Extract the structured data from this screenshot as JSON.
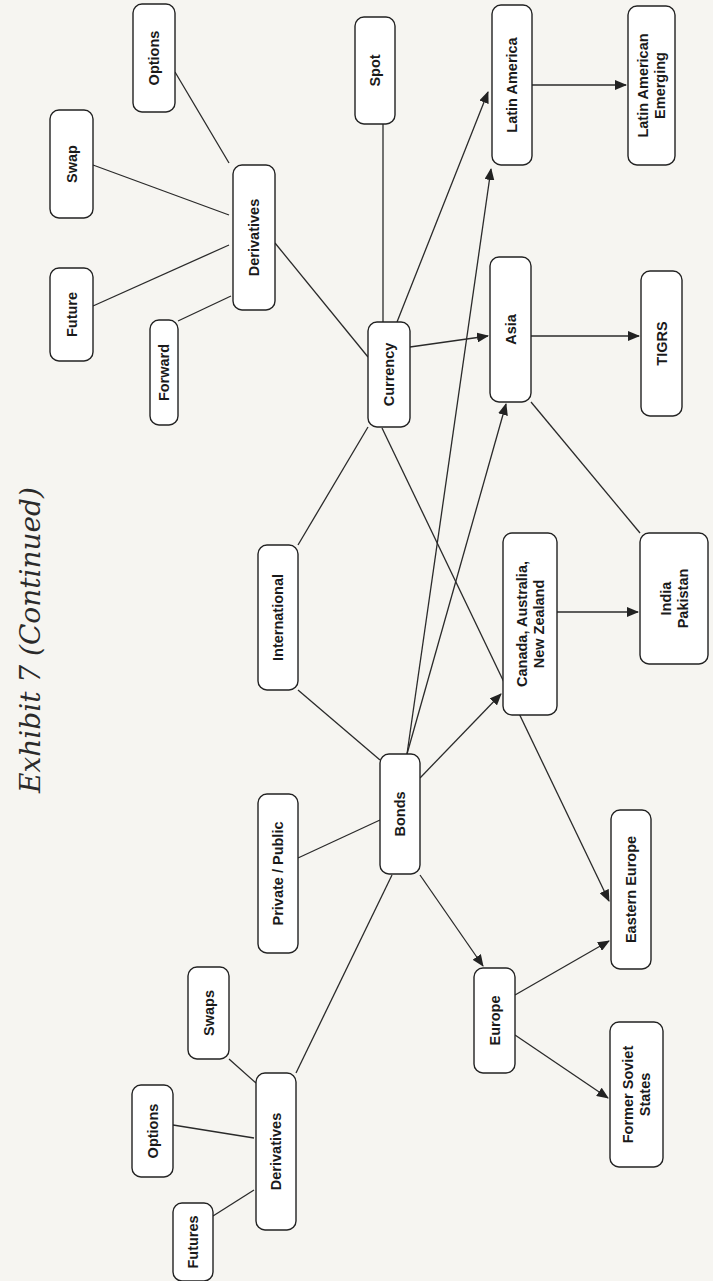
{
  "page": {
    "title": "Exhibit 7 (Continued)",
    "colors": {
      "background": "#f6f5f1",
      "node_fill": "#ffffff",
      "line": "#2a2a2a",
      "text": "#1a1a1a"
    }
  },
  "diagram": {
    "orientation": "rotated-90-ccw",
    "nodes": [
      {
        "id": "options_top",
        "label": [
          "Options"
        ],
        "x": 133,
        "y": 4,
        "w": 42,
        "h": 108
      },
      {
        "id": "swap",
        "label": [
          "Swap"
        ],
        "x": 50,
        "y": 110,
        "w": 43,
        "h": 108
      },
      {
        "id": "future",
        "label": [
          "Future"
        ],
        "x": 50,
        "y": 268,
        "w": 43,
        "h": 93
      },
      {
        "id": "forward",
        "label": [
          "Forward"
        ],
        "x": 150,
        "y": 320,
        "w": 28,
        "h": 105
      },
      {
        "id": "derivatives_top",
        "label": [
          "Derivatives"
        ],
        "x": 233,
        "y": 165,
        "w": 42,
        "h": 145
      },
      {
        "id": "spot",
        "label": [
          "Spot"
        ],
        "x": 355,
        "y": 17,
        "w": 40,
        "h": 107
      },
      {
        "id": "currency",
        "label": [
          "Currency"
        ],
        "x": 368,
        "y": 322,
        "w": 42,
        "h": 105
      },
      {
        "id": "latin_america",
        "label": [
          "Latin America"
        ],
        "x": 492,
        "y": 5,
        "w": 40,
        "h": 160
      },
      {
        "id": "latin_american_emerging",
        "label": [
          "Latin American",
          "Emerging"
        ],
        "x": 628,
        "y": 6,
        "w": 47,
        "h": 159
      },
      {
        "id": "asia",
        "label": [
          "Asia"
        ],
        "x": 490,
        "y": 257,
        "w": 41,
        "h": 145
      },
      {
        "id": "tigrs",
        "label": [
          "TIGRS"
        ],
        "x": 641,
        "y": 271,
        "w": 41,
        "h": 145
      },
      {
        "id": "international",
        "label": [
          "International"
        ],
        "x": 258,
        "y": 545,
        "w": 40,
        "h": 145
      },
      {
        "id": "canada",
        "label": [
          "Canada, Australia,",
          "New Zealand"
        ],
        "x": 503,
        "y": 533,
        "w": 54,
        "h": 182
      },
      {
        "id": "india_pakistan",
        "label": [
          "India",
          "Pakistan"
        ],
        "x": 640,
        "y": 533,
        "w": 68,
        "h": 131
      },
      {
        "id": "bonds",
        "label": [
          "Bonds"
        ],
        "x": 380,
        "y": 754,
        "w": 40,
        "h": 120
      },
      {
        "id": "private_public",
        "label": [
          "Private / Public"
        ],
        "x": 258,
        "y": 794,
        "w": 40,
        "h": 159
      },
      {
        "id": "eastern_europe",
        "label": [
          "Eastern Europe"
        ],
        "x": 611,
        "y": 810,
        "w": 40,
        "h": 159
      },
      {
        "id": "europe",
        "label": [
          "Europe"
        ],
        "x": 474,
        "y": 968,
        "w": 41,
        "h": 105
      },
      {
        "id": "former_soviet_states",
        "label": [
          "Former Soviet",
          "States"
        ],
        "x": 610,
        "y": 1022,
        "w": 53,
        "h": 145
      },
      {
        "id": "swaps",
        "label": [
          "Swaps"
        ],
        "x": 188,
        "y": 967,
        "w": 41,
        "h": 92
      },
      {
        "id": "options_bottom",
        "label": [
          "Options"
        ],
        "x": 132,
        "y": 1085,
        "w": 41,
        "h": 92
      },
      {
        "id": "derivatives_bottom",
        "label": [
          "Derivatives"
        ],
        "x": 256,
        "y": 1073,
        "w": 40,
        "h": 157
      },
      {
        "id": "futures",
        "label": [
          "Futures"
        ],
        "x": 173,
        "y": 1203,
        "w": 40,
        "h": 78
      }
    ],
    "edges": [
      {
        "from": [
          229,
          163
        ],
        "to": [
          175,
          72
        ],
        "arrow": false
      },
      {
        "from": [
          229,
          215
        ],
        "to": [
          93,
          165
        ],
        "arrow": false
      },
      {
        "from": [
          229,
          245
        ],
        "to": [
          93,
          306
        ],
        "arrow": false
      },
      {
        "from": [
          231,
          296
        ],
        "to": [
          178,
          321
        ],
        "arrow": false
      },
      {
        "from": [
          275,
          243
        ],
        "to": [
          368,
          357
        ],
        "arrow": false
      },
      {
        "from": [
          383,
          124
        ],
        "to": [
          383,
          322
        ],
        "arrow": false
      },
      {
        "from": [
          397,
          322
        ],
        "to": [
          488,
          92
        ],
        "arrow": true
      },
      {
        "from": [
          410,
          347
        ],
        "to": [
          488,
          336
        ],
        "arrow": true
      },
      {
        "from": [
          532,
          85
        ],
        "to": [
          626,
          85
        ],
        "arrow": true
      },
      {
        "from": [
          531,
          336
        ],
        "to": [
          639,
          336
        ],
        "arrow": true
      },
      {
        "from": [
          298,
          545
        ],
        "to": [
          368,
          427
        ],
        "arrow": false
      },
      {
        "from": [
          382,
          428
        ],
        "to": [
          609,
          901
        ],
        "arrow": true
      },
      {
        "from": [
          407,
          754
        ],
        "to": [
          491,
          169
        ],
        "arrow": true
      },
      {
        "from": [
          407,
          754
        ],
        "to": [
          506,
          404
        ],
        "arrow": true
      },
      {
        "from": [
          531,
          402
        ],
        "to": [
          640,
          533
        ],
        "arrow": false
      },
      {
        "from": [
          557,
          612
        ],
        "to": [
          638,
          612
        ],
        "arrow": true
      },
      {
        "from": [
          298,
          690
        ],
        "to": [
          380,
          760
        ],
        "arrow": false
      },
      {
        "from": [
          420,
          778
        ],
        "to": [
          501,
          694
        ],
        "arrow": true
      },
      {
        "from": [
          380,
          820
        ],
        "to": [
          298,
          858
        ],
        "arrow": false
      },
      {
        "from": [
          420,
          875
        ],
        "to": [
          483,
          966
        ],
        "arrow": true
      },
      {
        "from": [
          392,
          875
        ],
        "to": [
          296,
          1073
        ],
        "arrow": false
      },
      {
        "from": [
          515,
          995
        ],
        "to": [
          609,
          941
        ],
        "arrow": true
      },
      {
        "from": [
          515,
          1035
        ],
        "to": [
          608,
          1098
        ],
        "arrow": true
      },
      {
        "from": [
          229,
          1059
        ],
        "to": [
          256,
          1083
        ],
        "arrow": false
      },
      {
        "from": [
          173,
          1125
        ],
        "to": [
          254,
          1138
        ],
        "arrow": false
      },
      {
        "from": [
          213,
          1216
        ],
        "to": [
          254,
          1190
        ],
        "arrow": false
      }
    ]
  }
}
